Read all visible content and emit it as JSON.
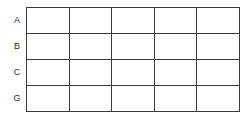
{
  "figure": {
    "kind": "empty-grid-table",
    "background_color": "#ffffff",
    "line_color": "#3a3a3a",
    "text_color": "#2b2b2b"
  },
  "grid": {
    "row_count": 4,
    "column_count": 5,
    "row_labels": [
      "A",
      "B",
      "C",
      "G"
    ],
    "rows": [
      {
        "label": "A",
        "cells": [
          "",
          "",
          "",
          "",
          ""
        ]
      },
      {
        "label": "B",
        "cells": [
          "",
          "",
          "",
          "",
          ""
        ]
      },
      {
        "label": "C",
        "cells": [
          "",
          "",
          "",
          "",
          ""
        ]
      },
      {
        "label": "G",
        "cells": [
          "",
          "",
          "",
          "",
          ""
        ]
      }
    ]
  }
}
